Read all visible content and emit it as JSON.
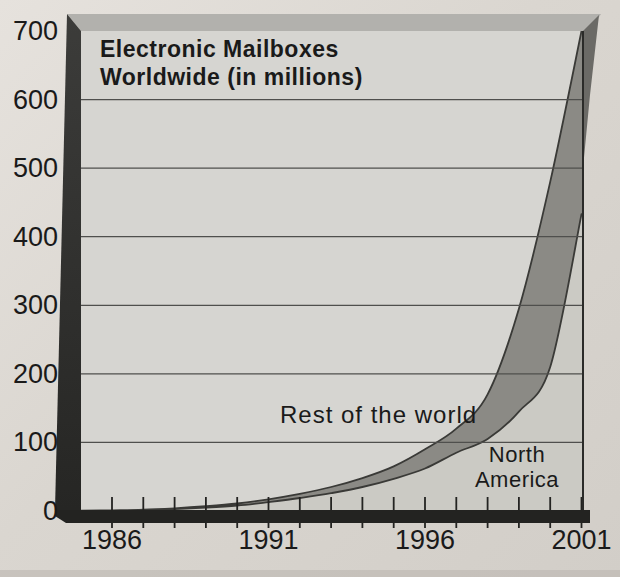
{
  "title": {
    "line1": "Electronic Mailboxes",
    "line2": "Worldwide (in millions)"
  },
  "annotations": {
    "rest_of_world": "Rest of the world",
    "north_america_line1": "North",
    "north_america_line2": "America"
  },
  "chart_data": {
    "type": "area",
    "title": "Electronic Mailboxes Worldwide (in millions)",
    "stacked": true,
    "x": [
      1985,
      1986,
      1987,
      1988,
      1989,
      1990,
      1991,
      1992,
      1993,
      1994,
      1995,
      1996,
      1997,
      1998,
      1999,
      2000,
      2001
    ],
    "series": [
      {
        "name": "North America",
        "values": [
          0.3,
          0.7,
          1.4,
          2.8,
          5,
          8,
          13,
          19,
          26,
          35,
          47,
          62,
          85,
          105,
          145,
          210,
          433
        ]
      },
      {
        "name": "Rest of the world",
        "values": [
          0.2,
          0.3,
          0.6,
          1.2,
          2,
          3,
          4,
          6,
          9,
          13,
          18,
          28,
          35,
          65,
          150,
          270,
          267
        ]
      }
    ],
    "ylim": [
      0,
      700
    ],
    "y_ticks": [
      0,
      100,
      200,
      300,
      400,
      500,
      600,
      700
    ],
    "x_tick_years": [
      1986,
      1987,
      1988,
      1989,
      1990,
      1991,
      1992,
      1993,
      1994,
      1995,
      1996,
      1997,
      1998,
      1999,
      2000,
      2001
    ],
    "x_label_years": [
      1986,
      1991,
      1996,
      2001
    ],
    "x_tick_labels": [
      "1986",
      "1991",
      "1996",
      "2001"
    ],
    "grid": "horizontal-only",
    "legend": "none",
    "colors": {
      "outer_bg": "#dad6d0",
      "plot_bg": "#d6d5d1",
      "north_america_fill": "#cbcac4",
      "rest_of_world_fill": "#8b8a85",
      "curve_line": "#3a3a37",
      "gridline": "#4f4f4d",
      "frame_top_face": "#b2b1ad",
      "frame_side": "#333331",
      "text": "#1a1a1a"
    }
  }
}
